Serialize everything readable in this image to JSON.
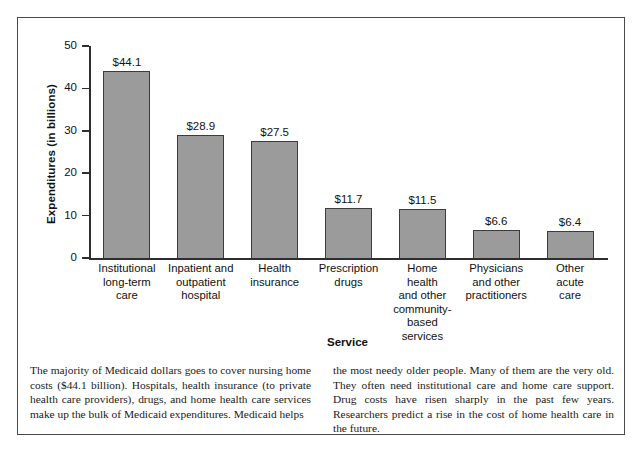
{
  "chart_data": {
    "type": "bar",
    "title": "",
    "xlabel": "Service",
    "ylabel": "Expenditures (in billions)",
    "ylim": [
      0,
      50
    ],
    "yticks": [
      0,
      10,
      20,
      30,
      40,
      50
    ],
    "ytick_labels": [
      "0",
      "10",
      "20",
      "30",
      "40",
      "50"
    ],
    "grid": false,
    "legend": "none",
    "bar_fill_color": "#9b9b9b",
    "bar_edge_color": "#3c3c3c",
    "categories": [
      "Institutional long-term care",
      "Inpatient and outpatient hospital",
      "Health insurance",
      "Prescription drugs",
      "Home health and other community-based services",
      "Physicians and other practitioners",
      "Other acute care"
    ],
    "category_label_lines": [
      [
        "Institutional",
        "long-term",
        "care"
      ],
      [
        "Inpatient and",
        "outpatient",
        "hospital"
      ],
      [
        "Health",
        "insurance"
      ],
      [
        "Prescription",
        "drugs"
      ],
      [
        "Home",
        "health",
        "and other",
        "community-",
        "based",
        "services"
      ],
      [
        "Physicians",
        "and other",
        "practitioners"
      ],
      [
        "Other",
        "acute",
        "care"
      ]
    ],
    "values": [
      44.1,
      28.9,
      27.5,
      11.7,
      11.5,
      6.6,
      6.4
    ],
    "value_labels": [
      "$44.1",
      "$28.9",
      "$27.5",
      "$11.7",
      "$11.5",
      "$6.6",
      "$6.4"
    ]
  },
  "caption": {
    "left_column": "The majority of Medicaid dollars goes to cover nursing home costs ($44.1 billion). Hospitals, health insurance (to private health care providers), drugs, and home health care services make up the bulk of Medicaid expenditures. Medicaid helps",
    "right_column": "the most needy older people. Many of them are the very old. They often need institutional care and home care support. Drug costs have risen sharply in the past few years. Researchers predict a rise in the cost of home health care in the future."
  }
}
